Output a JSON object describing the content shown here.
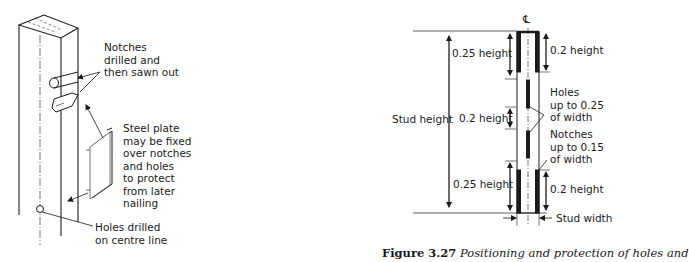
{
  "left_figure": {
    "labels": {
      "notches": [
        "Notches",
        "drilled and",
        "then sawn out"
      ],
      "steel_plate": [
        "Steel plate",
        "may be fixed",
        "over notches",
        "and holes",
        "to protect",
        "from later",
        "nailing"
      ],
      "holes": [
        "Holes drilled",
        "on centre line"
      ]
    }
  },
  "right_figure": {
    "centre_line_symbol": "℄",
    "labels": {
      "stud_height": "Stud height",
      "top_left": "0.25 height",
      "middle_left": "0.2 height",
      "bottom_left": "0.25 height",
      "top_right": "0.2 height",
      "bottom_right": "0.2 height",
      "holes": [
        "Holes",
        "up to 0.25",
        "of width"
      ],
      "notches": [
        "Notches",
        "up to 0.15",
        "of width"
      ],
      "stud_width": "Stud width"
    }
  },
  "caption": {
    "number": "Figure 3.27",
    "text": "Positioning and protection of holes and"
  }
}
